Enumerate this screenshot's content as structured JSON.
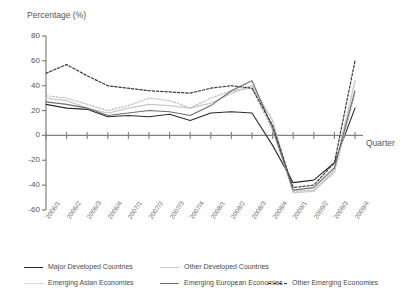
{
  "chart_data": {
    "type": "line",
    "title": "",
    "ylabel": "Percentage (%)",
    "xlabel": "Quarter",
    "ylim": [
      -60,
      80
    ],
    "yticks": [
      80,
      60,
      40,
      20,
      0,
      -20,
      -40,
      -60
    ],
    "grid": false,
    "legend_position": "bottom",
    "categories": [
      "2006/1",
      "2006/2",
      "2006/3",
      "2006/4",
      "2007/1",
      "2007/2",
      "2007/3",
      "2007/4",
      "2008/1",
      "2008/2",
      "2008/3",
      "2008/4",
      "2009/1",
      "2009/2",
      "2009/3",
      "2009/4"
    ],
    "series": [
      {
        "name": "Major Developed Countries",
        "style": "solid",
        "color": "#2b2b2b",
        "width": 1.1,
        "values": [
          25,
          22,
          21,
          15,
          16,
          15,
          17,
          12,
          18,
          19,
          18,
          -8,
          -38,
          -36,
          -22,
          22
        ]
      },
      {
        "name": "Other Developed Countries",
        "style": "solid",
        "color": "#c9c9c9",
        "width": 1.4,
        "values": [
          30,
          28,
          22,
          18,
          22,
          25,
          24,
          22,
          26,
          34,
          40,
          12,
          -46,
          -45,
          -28,
          44
        ]
      },
      {
        "name": "Emerging Asian Economies",
        "style": "dotted-light",
        "color": "#bdbdbd",
        "width": 1.2,
        "values": [
          32,
          30,
          25,
          20,
          24,
          30,
          28,
          22,
          30,
          36,
          38,
          4,
          -45,
          -44,
          -30,
          34
        ]
      },
      {
        "name": "Emerging European Economies",
        "style": "solid",
        "color": "#6e6e6e",
        "width": 1.1,
        "values": [
          27,
          25,
          22,
          16,
          18,
          20,
          19,
          16,
          24,
          36,
          44,
          6,
          -44,
          -42,
          -26,
          36
        ]
      },
      {
        "name": "Other Emerging Economies",
        "style": "dotted-dark",
        "color": "#3a3a3a",
        "width": 1.2,
        "values": [
          50,
          57,
          48,
          40,
          38,
          36,
          35,
          34,
          38,
          40,
          38,
          8,
          -42,
          -40,
          -22,
          60
        ]
      }
    ]
  },
  "legend": {
    "items": [
      {
        "label": "Major Developed Countries"
      },
      {
        "label": "Other Developed Countries"
      },
      {
        "label": "Emerging Asian Economies"
      },
      {
        "label": "Emerging European Economies"
      },
      {
        "label": "Other Emerging Economies"
      }
    ]
  }
}
